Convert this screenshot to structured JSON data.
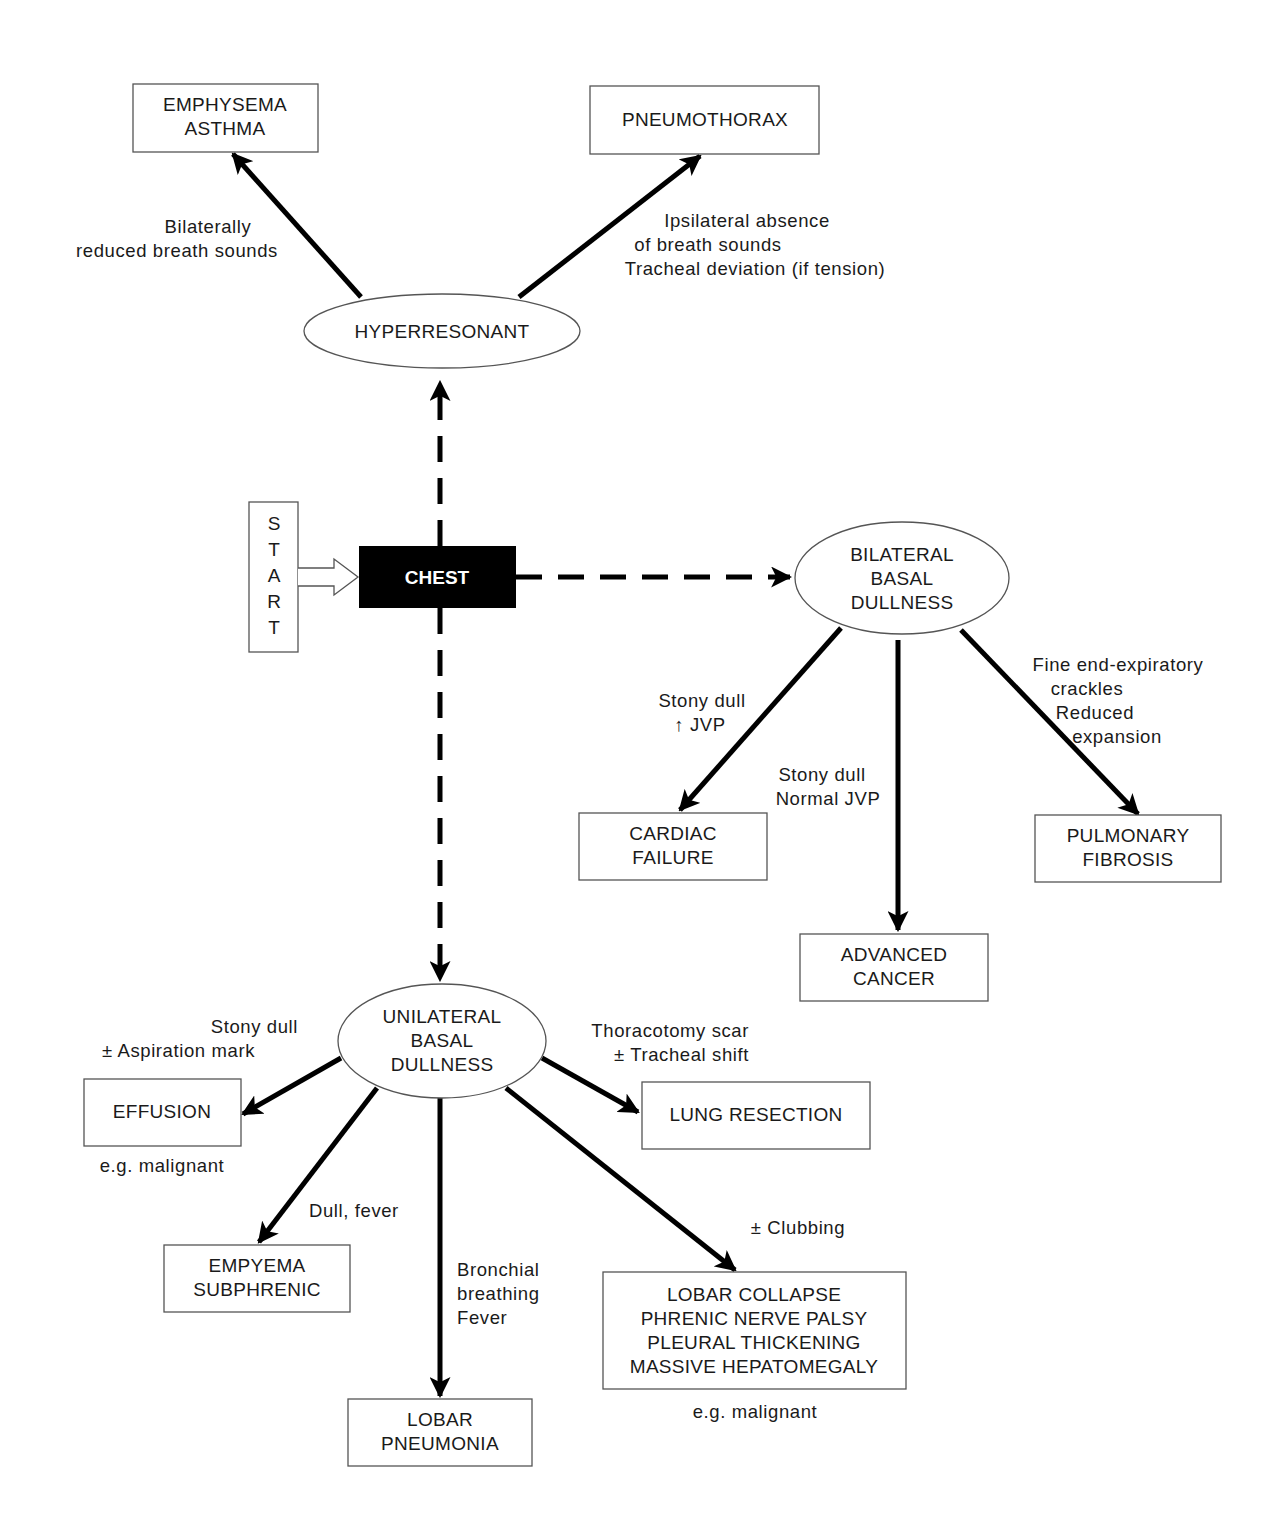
{
  "start": {
    "letters": [
      "S",
      "T",
      "A",
      "R",
      "T"
    ]
  },
  "root": {
    "label": "CHEST"
  },
  "branches": {
    "hyperresonant": {
      "label": "HYPERRESONANT",
      "children": [
        {
          "lines": [
            "EMPHYSEMA",
            "ASTHMA"
          ],
          "edge_label": [
            "Bilaterally",
            "reduced breath sounds"
          ]
        },
        {
          "lines": [
            "PNEUMOTHORAX"
          ],
          "edge_label": [
            "Ipsilateral absence",
            "of breath sounds",
            "Tracheal deviation (if tension)"
          ]
        }
      ]
    },
    "bilateral": {
      "label": [
        "BILATERAL",
        "BASAL",
        "DULLNESS"
      ],
      "children": [
        {
          "lines": [
            "CARDIAC",
            "FAILURE"
          ],
          "edge_label": [
            "Stony dull",
            "↑ JVP"
          ]
        },
        {
          "lines": [
            "ADVANCED",
            "CANCER"
          ],
          "edge_label": [
            "Stony dull",
            "Normal JVP"
          ]
        },
        {
          "lines": [
            "PULMONARY",
            "FIBROSIS"
          ],
          "edge_label": [
            "Fine end-expiratory",
            "crackles",
            "Reduced",
            "expansion"
          ]
        }
      ]
    },
    "unilateral": {
      "label": [
        "UNILATERAL",
        "BASAL",
        "DULLNESS"
      ],
      "children": [
        {
          "lines": [
            "EFFUSION"
          ],
          "edge_label": [
            "Stony dull",
            "± Aspiration mark"
          ],
          "note": "e.g. malignant"
        },
        {
          "lines": [
            "LUNG RESECTION"
          ],
          "edge_label": [
            "Thoracotomy scar",
            "± Tracheal shift"
          ]
        },
        {
          "lines": [
            "EMPYEMA",
            "SUBPHRENIC"
          ],
          "edge_label": [
            "Dull, fever"
          ]
        },
        {
          "lines": [
            "LOBAR",
            "PNEUMONIA"
          ],
          "edge_label": [
            "Bronchial",
            "breathing",
            "Fever"
          ]
        },
        {
          "lines": [
            "LOBAR COLLAPSE",
            "PHRENIC NERVE PALSY",
            "PLEURAL THICKENING",
            "MASSIVE HEPATOMEGALY"
          ],
          "edge_label": [
            "± Clubbing"
          ],
          "note": "e.g. malignant"
        }
      ]
    }
  },
  "colors": {
    "line": "#000000",
    "box_stroke": "#555555",
    "root_fill": "#000000",
    "root_text": "#ffffff"
  }
}
